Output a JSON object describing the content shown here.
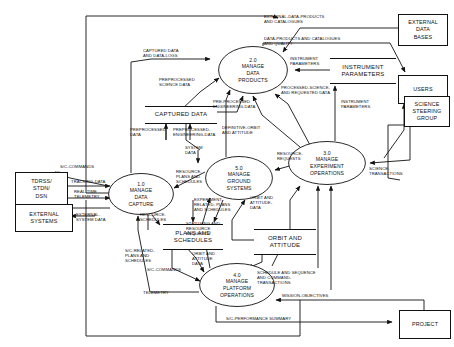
{
  "diagram": {
    "type": "data-flow-diagram"
  },
  "processes": [
    {
      "id": "1.0",
      "number": "1.0",
      "name": "MANAGE\nDATA\nCAPTURE",
      "label": "1.0\nMANAGE\nDATA\nCAPTURE",
      "cx": 141,
      "cy": 194,
      "rx": 33,
      "ry": 21
    },
    {
      "id": "2.0",
      "number": "2.0",
      "name": "MANAGE\nDATA\nPRODUCTS",
      "label": "2.0\nMANAGE\nDATA\nPRODUCTS",
      "cx": 253,
      "cy": 70,
      "rx": 35,
      "ry": 24
    },
    {
      "id": "3.0",
      "number": "3.0",
      "name": "MANAGE\nEXPERIMENT\nOPERATIONS",
      "label": "3.0\nMANAGE\nEXPERIMENT\nOPERATIONS",
      "cx": 327,
      "cy": 163,
      "rx": 39,
      "ry": 22
    },
    {
      "id": "4.0",
      "number": "4.0",
      "name": "MANAGE\nPLATFORM\nOPERATIONS",
      "label": "4.0\nMANAGE\nPLATFORM\nOPERATIONS",
      "cx": 237,
      "cy": 285,
      "rx": 38,
      "ry": 22
    },
    {
      "id": "5.0",
      "number": "5.0",
      "name": "MANAGE\nGROUND\nSYSTEMS",
      "label": "5.0\nMANAGE\nGROUND\nSYSTEMS",
      "cx": 239,
      "cy": 178,
      "rx": 34,
      "ry": 22
    }
  ],
  "entities": [
    {
      "id": "tdrss",
      "label": "TDRSS/\nSTDN/\nDSN",
      "x": 15,
      "y": 172,
      "w": 51,
      "h": 32
    },
    {
      "id": "external-systems",
      "label": "EXTERNAL\nSYSTEMS",
      "x": 15,
      "y": 204,
      "w": 56,
      "h": 26
    },
    {
      "id": "external-data-bases",
      "label": "EXTERNAL\nDATA\nBASES",
      "x": 398,
      "y": 14,
      "w": 48,
      "h": 30
    },
    {
      "id": "users",
      "label": "USERS",
      "x": 398,
      "y": 75,
      "w": 48,
      "h": 27
    },
    {
      "id": "science-steering-group",
      "label": "SCIENCE\nSTEERING\nGROUP",
      "x": 404,
      "y": 96,
      "w": 44,
      "h": 29
    },
    {
      "id": "project",
      "label": "PROJECT",
      "x": 399,
      "y": 310,
      "w": 50,
      "h": 27
    }
  ],
  "stores": [
    {
      "id": "captured-data",
      "label": "CAPTURED DATA",
      "x": 145,
      "y": 108,
      "w": 72,
      "h": 14
    },
    {
      "id": "instrument-parameters",
      "label": "INSTRUMENT\nPARAMETERS",
      "x": 330,
      "y": 60,
      "w": 66,
      "h": 22
    },
    {
      "id": "plans-and-schedules",
      "label": "PLANS AND\nSCHEDULES",
      "x": 163,
      "y": 225,
      "w": 60,
      "h": 22
    },
    {
      "id": "orbit-and-attitude",
      "label": "ORBIT AND\nATTITUDE",
      "x": 254,
      "y": 230,
      "w": 62,
      "h": 22
    }
  ],
  "flows": [
    {
      "id": "captured-data-and-data-logs",
      "label": "CAPTURED DATA\nAND DATA-LOGS",
      "x": 143,
      "y": 49
    },
    {
      "id": "external-data-products-and-catalogues",
      "label": "EXTERNAL-DATA-PRODUCTS\nAND CATALOGUES",
      "x": 264,
      "y": 14
    },
    {
      "id": "data-products-and-catalogues-and-quality",
      "label": "DATA-PRODUCTS AND CATALOGUES\nAND QUALITY",
      "x": 264,
      "y": 37
    },
    {
      "id": "preprocessed-science-data",
      "label": "PREPROCESSED\nSCIENCE DATA",
      "x": 160,
      "y": 78
    },
    {
      "id": "instrument-parameters-flow-a",
      "label": "INSTRUMENT\nPARAMETERS",
      "x": 287,
      "y": 57
    },
    {
      "id": "processed-science-and-requested-data",
      "label": "PROCESSED-SCIENCE-\nAND REQUESTED DATA",
      "x": 283,
      "y": 86
    },
    {
      "id": "pre-processed-engineering-data",
      "label": "PRE-PROCESSED\nENGINEERING-DATA",
      "x": 214,
      "y": 100
    },
    {
      "id": "preprocessed-data",
      "label": "PREPROCESSED\nDATA",
      "x": 133,
      "y": 127
    },
    {
      "id": "preprocessed-engineering-data",
      "label": "PREPROCESSED-\nENGINEERING-DATA",
      "x": 172,
      "y": 128
    },
    {
      "id": "instrument-parameters-flow-b",
      "label": "INSTRUMENT\nPARAMETERS",
      "x": 349,
      "y": 100
    },
    {
      "id": "definitive-orbit-and-attitude",
      "label": "DEFINITIVE-ORBIT\nAND ATTITUDE",
      "x": 247,
      "y": 126
    },
    {
      "id": "system-data",
      "label": "SYSTEM\nDATA",
      "x": 186,
      "y": 146
    },
    {
      "id": "resource-requests",
      "label": "RESOURCE-\nREQUESTS",
      "x": 285,
      "y": 152
    },
    {
      "id": "science-transactions",
      "label": "SCIENCE-\nTRANSACTIONS",
      "x": 374,
      "y": 164
    },
    {
      "id": "sc-commands",
      "label": "S/C-COMMANDS",
      "x": 60,
      "y": 165
    },
    {
      "id": "tracking-data",
      "label": "TRACKING-DATA",
      "x": 72,
      "y": 180
    },
    {
      "id": "real-time-telemetry",
      "label": "REAL-TIME\nTELEMETRY",
      "x": 75,
      "y": 190
    },
    {
      "id": "resource-plans-and-schedules",
      "label": "RESOURCE-\nPLANS AND\nSCHEDULES",
      "x": 179,
      "y": 170
    },
    {
      "id": "external-system-data",
      "label": "EXTERNAL-\nSYSTEM DATA",
      "x": 78,
      "y": 214
    },
    {
      "id": "resource-schedules",
      "label": "RESOURCE-\nSCHEDULES",
      "x": 144,
      "y": 214
    },
    {
      "id": "experiment-related-plans-and-schedules",
      "label": "EXPERIMENT-\nRELATED- PLANS\nAND SCHEDULES",
      "x": 196,
      "y": 198
    },
    {
      "id": "orbit-and-attitude-data-a",
      "label": "ORBIT AND\nATTITUDE-\nDATA",
      "x": 252,
      "y": 196
    },
    {
      "id": "statusing-and-resource-requests",
      "label": "STATUSING AND\nRESOURCE\nREQUESTS",
      "x": 190,
      "y": 222
    },
    {
      "id": "sc-related-plans-and-schedules",
      "label": "S/C-RELATED-\nPLANS AND\nSCHEDULES",
      "x": 131,
      "y": 249
    },
    {
      "id": "orbit-and-attitude-data-b",
      "label": "ORBIT AND\nATTITUDE\nDATA",
      "x": 196,
      "y": 252
    },
    {
      "id": "sc-commands-2",
      "label": "S/C-COMMANDS",
      "x": 151,
      "y": 268
    },
    {
      "id": "schedule-and-sequence-and-command-transactions",
      "label": "SCHEDULE AND SEQUENCE\nAND COMMAND-\nTRANSACTIONS",
      "x": 268,
      "y": 272
    },
    {
      "id": "telemetry",
      "label": "TELEMETRY",
      "x": 148,
      "y": 291
    },
    {
      "id": "mission-objectives",
      "label": "MISSION-OBJECTIVES",
      "x": 292,
      "y": 294
    },
    {
      "id": "sc-performance-summary",
      "label": "S/C-PERFORMANCE SUMMARY",
      "x": 235,
      "y": 317
    }
  ]
}
